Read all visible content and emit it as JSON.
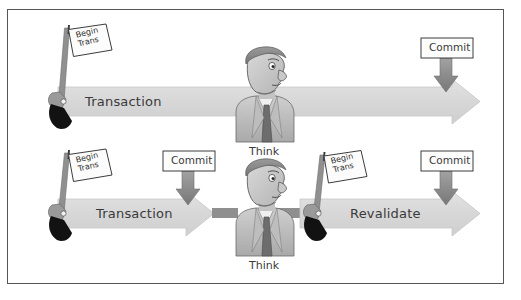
{
  "figure": {
    "background_color": "#ffffff",
    "frame_color": "#565656",
    "arrow_fill": "#d9d9d9",
    "arrow_edge": "#bdbdbd",
    "connector_fill": "#8f8f8f",
    "commit_arrow_fill": "#8c8c8c",
    "flag_fill": "#fbfbfb",
    "flag_edge": "#3a3a3a",
    "gun_barrel_color": "#8a8a8a",
    "gun_grip_color": "#111111"
  },
  "rows": [
    {
      "id": "row-top",
      "start_marker": {
        "name": "begin-trans-flag",
        "line1": "Begin",
        "line2": "Trans"
      },
      "track_label": "Transaction",
      "think_label": "Think",
      "end_markers": [
        {
          "name": "commit-marker",
          "label": "Commit"
        }
      ]
    },
    {
      "id": "row-bottom",
      "start_marker": {
        "name": "begin-trans-flag",
        "line1": "Begin",
        "line2": "Trans"
      },
      "track_label": "Transaction",
      "mid_marker": {
        "name": "commit-marker",
        "label": "Commit"
      },
      "think_label": "Think",
      "second_marker": {
        "name": "begin-trans-flag",
        "line1": "Begin",
        "line2": "Trans"
      },
      "second_track_label": "Revalidate",
      "end_markers": [
        {
          "name": "commit-marker",
          "label": "Commit"
        }
      ]
    }
  ],
  "labels": {
    "begin_line1": "Begin",
    "begin_line2": "Trans",
    "transaction": "Transaction",
    "revalidate": "Revalidate",
    "commit": "Commit",
    "think": "Think"
  }
}
